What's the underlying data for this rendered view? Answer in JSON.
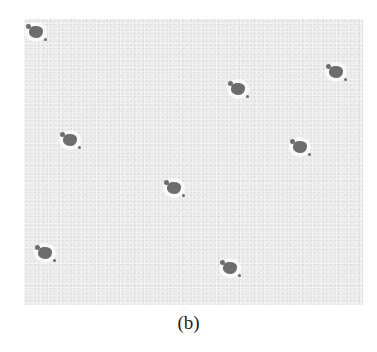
{
  "figure": {
    "caption": "(b)",
    "panel": {
      "background_color": "#ebebeb",
      "blob_color": "#6d6d6d"
    },
    "blobs": [
      {
        "x": 36,
        "y": 32
      },
      {
        "x": 238,
        "y": 89
      },
      {
        "x": 336,
        "y": 72
      },
      {
        "x": 70,
        "y": 140
      },
      {
        "x": 300,
        "y": 147
      },
      {
        "x": 174,
        "y": 188
      },
      {
        "x": 45,
        "y": 253
      },
      {
        "x": 230,
        "y": 268
      }
    ]
  }
}
